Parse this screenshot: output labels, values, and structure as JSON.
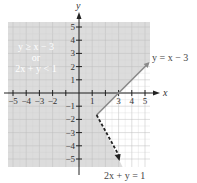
{
  "chart_data": {
    "type": "line",
    "title": "",
    "xlabel": "x",
    "ylabel": "y",
    "xlim": [
      -5.5,
      5.5
    ],
    "ylim": [
      -5.5,
      5.5
    ],
    "grid": true,
    "x_ticks": [
      -5,
      -4,
      -3,
      -2,
      -1,
      1,
      2,
      3,
      4,
      5
    ],
    "x_tick_labels": [
      "−5",
      "−4",
      "−3",
      "−2",
      "1",
      "3",
      "4",
      "5"
    ],
    "y_ticks": [
      -5,
      -4,
      -3,
      -2,
      -1,
      1,
      2,
      3,
      4,
      5
    ],
    "y_tick_labels": [
      "5",
      "4",
      "3",
      "2",
      "1",
      "−1",
      "−2",
      "−3",
      "−4",
      "−5"
    ],
    "series": [
      {
        "name": "y = x − 3",
        "style": "solid",
        "color": "#8a8a8a",
        "points": [
          [
            1.333,
            -1.667
          ],
          [
            5.2,
            2.2
          ]
        ]
      },
      {
        "name": "2x + y = 1",
        "style": "dashed",
        "color": "#222222",
        "points": [
          [
            1.333,
            -1.667
          ],
          [
            3,
            -5
          ]
        ]
      }
    ],
    "vertex": [
      1.333,
      -1.667
    ],
    "shaded_region": {
      "description": "y ≥ x − 3 or 2x + y < 1",
      "color": "#dcdcdc"
    },
    "annotations": [
      {
        "text": "y ≥ x − 3",
        "x": -3.5,
        "y": 3
      },
      {
        "text": "or",
        "x": -3.5,
        "y": 2.3
      },
      {
        "text": "2x + y < 1",
        "x": -3.5,
        "y": 1.6
      },
      {
        "text": "y = x − 3",
        "x": 5.3,
        "y": 2.7
      },
      {
        "text": "2x + y = 1",
        "x": 3.7,
        "y": -6.5
      }
    ]
  },
  "labels": {
    "x_axis": "x",
    "y_axis": "y",
    "region_line1": "y ≥ x − 3",
    "region_line2": "or",
    "region_line3": "2x + y < 1",
    "line1": "y = x − 3",
    "line2": "2x + y = 1"
  }
}
